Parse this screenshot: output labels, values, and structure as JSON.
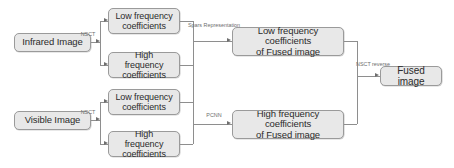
{
  "diagram": {
    "style": {
      "node_fill": "#e8e8e8",
      "node_border": "#9a9a9a",
      "line_color": "#8e8e8e",
      "text_color": "#2b2b2b",
      "label_color": "#6d6d6d",
      "background": "#ffffff"
    },
    "nodes": {
      "infrared_image": "Infrared Image",
      "visible_image": "Visible Image",
      "ir_low_line1": "Low frequency",
      "ir_low_line2": "coefficients",
      "ir_high_line1": "High frequency",
      "ir_high_line2": "coefficients",
      "vis_low_line1": "Low frequency",
      "vis_low_line2": "coefficients",
      "vis_high_line1": "High frequency",
      "vis_high_line2": "coefficients",
      "fused_low_line1": "Low frequency coefficients",
      "fused_low_line2": "of Fused image",
      "fused_high_line1": "High frequency coefficients",
      "fused_high_line2": "of Fused image",
      "fused_image": "Fused image"
    },
    "edge_labels": {
      "nsct_infrared": "NSCT",
      "nsct_visible": "NSCT",
      "sparse_line1": "Spars",
      "sparse_line2": "Representation",
      "pcnn": "PCNN",
      "nsct_reverse_line1": "NSCT",
      "nsct_reverse_line2": "reverse"
    }
  }
}
